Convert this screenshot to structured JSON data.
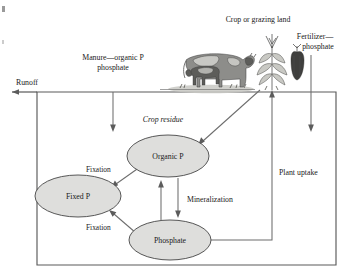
{
  "figure": {
    "type": "flow-diagram"
  },
  "labels": {
    "runoff": "Runoff",
    "manure": "Manure—organic P",
    "manure_line2": "phosphate",
    "crop_or_grazing_land": "Crop or grazing land",
    "fertilizer": "Fertilizer—",
    "fertilizer_line2": "phosphate",
    "crop_residue": "Crop residue",
    "plant_uptake": "Plant uptake",
    "mineralization": "Mineralization",
    "fixation_upper": "Fixation",
    "fixation_lower": "Fixation"
  },
  "nodes": [
    {
      "id": "organic-p",
      "label": "Organic P",
      "cx": 168,
      "cy": 156,
      "rx": 41,
      "ry": 21
    },
    {
      "id": "fixed-p",
      "label": "Fixed P",
      "cx": 78,
      "cy": 196,
      "rx": 43,
      "ry": 21
    },
    {
      "id": "phosphate",
      "label": "Phosphate",
      "cx": 170,
      "cy": 240,
      "rx": 41,
      "ry": 20
    }
  ],
  "illustrations": [
    {
      "id": "cow-with-calf",
      "name": "cow-illustration"
    },
    {
      "id": "corn-plant",
      "name": "corn-plant-illustration"
    },
    {
      "id": "corn-cob",
      "name": "corn-cob-illustration"
    }
  ],
  "colors": {
    "node_fill": "#dededc",
    "node_stroke": "#4f4f4f",
    "edge": "#6d6d6d",
    "box": "#5a5a5a",
    "text": "#191919",
    "background": "#ffffff"
  },
  "soil_box": {
    "x": 37,
    "y": 92,
    "width": 299,
    "height": 173
  }
}
